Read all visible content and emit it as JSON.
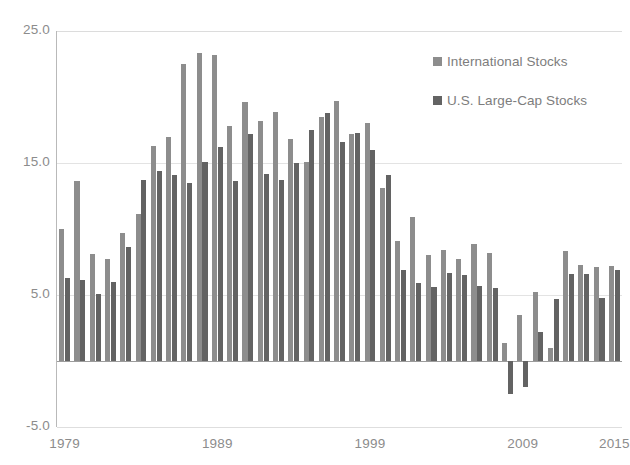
{
  "chart_data": {
    "type": "bar",
    "title": "",
    "subtitle": "",
    "xlabel": "",
    "ylabel": "",
    "ylim": [
      -5.0,
      25.0
    ],
    "yticks": [
      "25.0",
      "15.0",
      "5.0",
      "-5.0"
    ],
    "ytick_values": [
      25.0,
      15.0,
      5.0,
      -5.0
    ],
    "xticks": [
      "1979",
      "1989",
      "1999",
      "2009",
      "2015"
    ],
    "xtick_values": [
      1979,
      1989,
      1999,
      2009,
      2015
    ],
    "grid": true,
    "legend_position": "top-right",
    "categories": [
      1979,
      1980,
      1981,
      1982,
      1983,
      1984,
      1985,
      1986,
      1987,
      1988,
      1989,
      1990,
      1991,
      1992,
      1993,
      1994,
      1995,
      1996,
      1997,
      1998,
      1999,
      2000,
      2001,
      2002,
      2003,
      2004,
      2005,
      2006,
      2007,
      2008,
      2009,
      2010,
      2011,
      2012,
      2013,
      2014,
      2015
    ],
    "series": [
      {
        "name": "International Stocks",
        "color": "#8d8d8d",
        "values": [
          10.0,
          13.6,
          8.1,
          7.7,
          9.7,
          11.1,
          16.3,
          17.0,
          22.5,
          23.3,
          23.2,
          17.8,
          19.6,
          18.2,
          18.9,
          16.8,
          15.1,
          18.5,
          19.7,
          17.2,
          18.0,
          13.1,
          9.1,
          10.9,
          8.0,
          8.4,
          7.7,
          8.9,
          8.2,
          1.4,
          3.5,
          5.2,
          1.0,
          8.3,
          7.3,
          7.1,
          7.2
        ]
      },
      {
        "name": "U.S. Large-Cap Stocks",
        "color": "#636363",
        "values": [
          6.3,
          6.1,
          5.1,
          6.0,
          8.6,
          13.7,
          14.4,
          14.1,
          13.5,
          15.1,
          16.2,
          13.6,
          17.2,
          14.2,
          13.7,
          15.0,
          17.5,
          18.8,
          16.6,
          17.3,
          16.0,
          14.1,
          6.9,
          5.9,
          5.6,
          6.7,
          6.5,
          5.7,
          5.5,
          -2.5,
          -2.0,
          2.2,
          4.7,
          6.6,
          6.6,
          4.8,
          6.9
        ]
      }
    ]
  },
  "legend": {
    "items": [
      {
        "label": "International Stocks",
        "color": "#8d8d8d",
        "key": "intl"
      },
      {
        "label": "U.S. Large-Cap Stocks",
        "color": "#636363",
        "key": "uslarge"
      }
    ]
  },
  "colors": {
    "international_stocks": "#8d8d8d",
    "us_large_cap_stocks": "#636363",
    "axis": "#b9b9b9",
    "gridline": "#e3e3e3",
    "zero_line": "#9c9c9c",
    "tick_text": "#8c8c8c",
    "legend_text": "#7d7d7d",
    "background": "#ffffff"
  }
}
